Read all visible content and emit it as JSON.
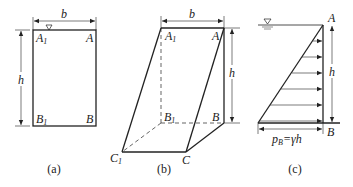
{
  "figure_a": {
    "caption": "(a)",
    "dim_width": "b",
    "dim_height": "h",
    "corner_top_left": "A",
    "corner_top_left_sub": "1",
    "corner_top_right": "A",
    "corner_bottom_left": "B",
    "corner_bottom_left_sub": "1",
    "corner_bottom_right": "B"
  },
  "figure_b": {
    "caption": "(b)",
    "dim_width": "b",
    "dim_height": "h",
    "vertex_A1": "A",
    "vertex_A1_sub": "1",
    "vertex_A": "A",
    "vertex_B1": "B",
    "vertex_B1_sub": "1",
    "vertex_B": "B",
    "vertex_C1": "C",
    "vertex_C1_sub": "1",
    "vertex_C": "C"
  },
  "figure_c": {
    "caption": "(c)",
    "dim_height": "h",
    "point_top": "A",
    "point_bottom": "B",
    "pressure_label_p": "p",
    "pressure_label_sub": "B",
    "pressure_label_eq": "=γh",
    "arrow_count": 6
  },
  "colors": {
    "line": "#222222",
    "background": "#ffffff"
  }
}
